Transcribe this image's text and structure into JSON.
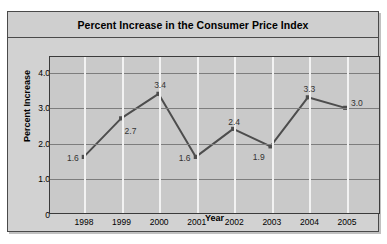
{
  "chart_data": {
    "type": "line",
    "title": "Percent Increase in the Consumer Price Index",
    "xlabel": "Year",
    "ylabel": "Percent Increase",
    "categories": [
      "1998",
      "1999",
      "2000",
      "2001",
      "2002",
      "2003",
      "2004",
      "2005"
    ],
    "values": [
      1.6,
      2.7,
      3.4,
      1.6,
      2.4,
      1.9,
      3.3,
      3.0
    ],
    "point_labels": [
      "1.6",
      "2.7",
      "3.4",
      "1.6",
      "2.4",
      "1.9",
      "3.3",
      "3.0"
    ],
    "y_ticks": [
      "0",
      "1.0",
      "2.0",
      "3.0",
      "4.0"
    ],
    "y_tick_values": [
      0,
      1.0,
      2.0,
      3.0,
      4.0
    ],
    "ylim": [
      0,
      4.45
    ],
    "grid": {
      "horizontal": true,
      "vertical": true,
      "horizontal_color": "#7d7d7d",
      "vertical_color": "#f2f2f2"
    },
    "legend": null,
    "series_color": "#4d4d4d",
    "marker": "square",
    "plot_background": "#c9c9c9",
    "figure_background": "#d2d2d2"
  },
  "axis": {
    "y_title": "Percent Increase",
    "x_title": "Year"
  }
}
